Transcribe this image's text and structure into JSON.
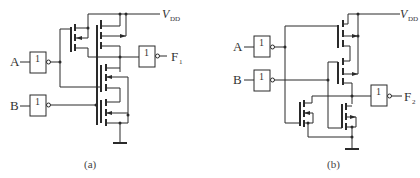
{
  "circuits": [
    {
      "id": "a",
      "caption": "(a)",
      "inputs": [
        {
          "label": "A",
          "gate_label": "1"
        },
        {
          "label": "B",
          "gate_label": "1"
        }
      ],
      "supply": {
        "label": "V",
        "subscript": "DD"
      },
      "output": {
        "label": "F",
        "subscript": "1",
        "gate_label": "1"
      }
    },
    {
      "id": "b",
      "caption": "(b)",
      "inputs": [
        {
          "label": "A",
          "gate_label": "1"
        },
        {
          "label": "B",
          "gate_label": "1"
        }
      ],
      "supply": {
        "label": "V",
        "subscript": "DD"
      },
      "output": {
        "label": "F",
        "subscript": "2",
        "gate_label": "1"
      }
    }
  ],
  "colors": {
    "line": "#2a2a2a",
    "background": "#ffffff"
  }
}
